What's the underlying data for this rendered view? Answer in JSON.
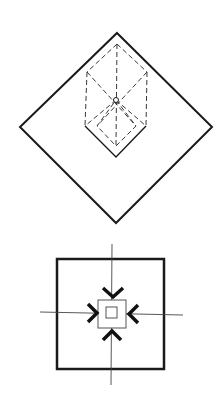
{
  "canvas": {
    "width": 222,
    "height": 405,
    "background": "#ffffff"
  },
  "colors": {
    "stroke": "#1a1a1a",
    "dashed": "#3a3a3a",
    "thin": "#444444"
  },
  "figures": [
    {
      "name": "isometric-box-in-diamond",
      "outer_diamond": {
        "top": [
          117,
          33
        ],
        "right": [
          212,
          127
        ],
        "bottom": [
          116,
          223
        ],
        "left": [
          20,
          127
        ]
      },
      "hexagon": {
        "top": [
          117,
          44
        ],
        "upper_left": [
          87,
          72
        ],
        "upper_right": [
          147,
          72
        ],
        "lower_left": [
          85,
          126
        ],
        "lower_right": [
          146,
          126
        ],
        "bottom": [
          116,
          157
        ]
      },
      "center": [
        116,
        100
      ],
      "inner_diamond": {
        "top": [
          116,
          100
        ],
        "left": [
          97,
          126
        ],
        "right": [
          136,
          126
        ],
        "bottom": [
          116,
          146
        ]
      }
    },
    {
      "name": "square-with-converging-arrows",
      "outer_square": {
        "x": 57,
        "y": 259,
        "w": 107,
        "h": 110
      },
      "middle_square": {
        "x": 98,
        "y": 300,
        "w": 28,
        "h": 28
      },
      "inner_square": {
        "x": 106,
        "y": 307,
        "w": 11,
        "h": 11
      },
      "crosshair": {
        "v_x": 112,
        "v_y1": 244,
        "v_y2": 385,
        "h_y": 313,
        "h_x1": 40,
        "h_x2": 183
      },
      "arrows": [
        {
          "dir": "down",
          "points": [
            [
              103,
              288
            ],
            [
              113,
              297
            ],
            [
              123,
              288
            ]
          ]
        },
        {
          "dir": "right",
          "points": [
            [
              88,
              304
            ],
            [
              97,
              313
            ],
            [
              88,
              322
            ]
          ]
        },
        {
          "dir": "left",
          "points": [
            [
              138,
              305
            ],
            [
              129,
              314
            ],
            [
              138,
              323
            ]
          ]
        },
        {
          "dir": "up",
          "points": [
            [
              103,
              340
            ],
            [
              112,
              331
            ],
            [
              121,
              340
            ]
          ]
        }
      ]
    }
  ]
}
